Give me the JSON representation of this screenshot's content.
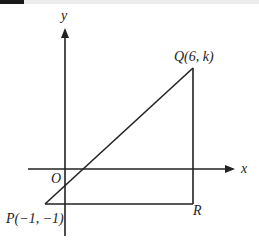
{
  "diagram": {
    "axes": {
      "x_label": "x",
      "y_label": "y",
      "origin_label": "O"
    },
    "points": {
      "P": {
        "name": "P",
        "coords_text": "(−1, −1)",
        "x": -1,
        "y": -1
      },
      "Q": {
        "name": "Q",
        "coords_text": "(6, k)",
        "x": 6,
        "y": "k"
      },
      "R": {
        "name": "R"
      }
    },
    "labels": {
      "P_full": "P(−1, −1)",
      "Q_full": "Q(6, k)",
      "R": "R"
    },
    "colors": {
      "line": "#222222",
      "background": "#ffffff"
    }
  }
}
